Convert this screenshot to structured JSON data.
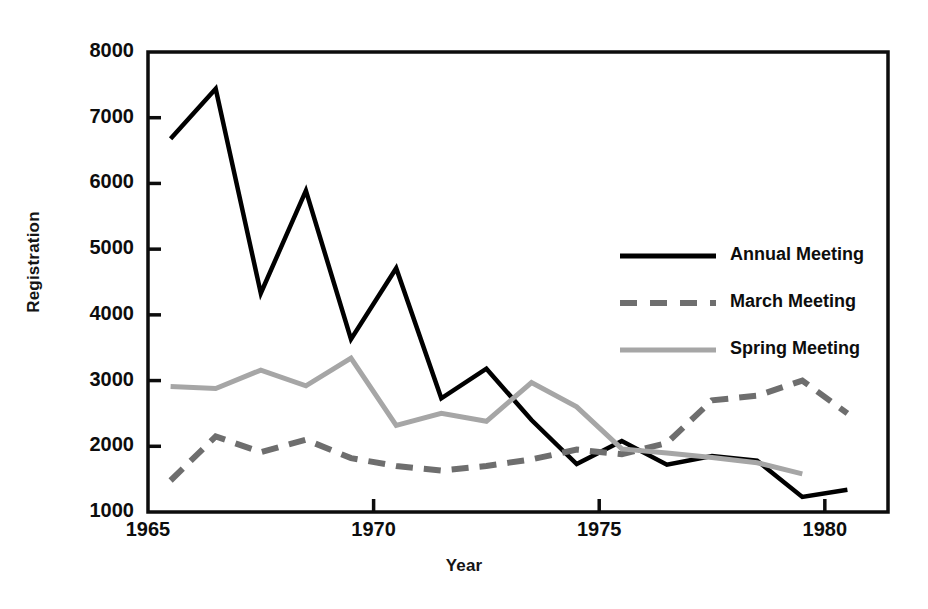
{
  "chart_data": {
    "type": "line",
    "title": "",
    "xlabel": "Year",
    "ylabel": "Registration",
    "xlim": [
      1965,
      1981.4
    ],
    "ylim": [
      1000,
      8000
    ],
    "xticks": [
      1965,
      1970,
      1975,
      1980
    ],
    "xtick_labels": [
      "1965",
      "1970",
      "1975",
      "1980"
    ],
    "yticks": [
      1000,
      2000,
      3000,
      4000,
      5000,
      6000,
      7000,
      8000
    ],
    "ytick_labels": [
      "1000",
      "2000",
      "3000",
      "4000",
      "5000",
      "6000",
      "7000",
      "8000"
    ],
    "grid": false,
    "legend_position": "upper right",
    "frame": "box",
    "series": [
      {
        "name": "Annual Meeting",
        "style": "solid",
        "color": "#000000",
        "width": 4.5,
        "x": [
          1965.5,
          1966.5,
          1967.5,
          1968.5,
          1969.5,
          1970.5,
          1971.5,
          1972.5,
          1973.5,
          1974.5,
          1975.5,
          1976.5,
          1977.5,
          1978.5,
          1979.5,
          1980.5
        ],
        "values": [
          6680,
          7440,
          4330,
          5890,
          3630,
          4710,
          2730,
          3180,
          2400,
          1730,
          2080,
          1720,
          1850,
          1780,
          1230,
          1340
        ]
      },
      {
        "name": "March Meeting",
        "style": "dashed",
        "color": "#6e6e6e",
        "width": 6,
        "x": [
          1965.5,
          1966.5,
          1967.5,
          1968.5,
          1969.5,
          1970.5,
          1971.5,
          1972.5,
          1973.5,
          1974.5,
          1975.5,
          1976.5,
          1977.5,
          1978.5,
          1979.5,
          1980.5
        ],
        "values": [
          1480,
          2150,
          1910,
          2100,
          1820,
          1700,
          1630,
          1700,
          1800,
          1950,
          1880,
          2050,
          2700,
          2770,
          3000,
          2500
        ]
      },
      {
        "name": "Spring Meeting",
        "style": "solid",
        "color": "#a6a6a6",
        "width": 5,
        "x": [
          1965.5,
          1966.5,
          1967.5,
          1968.5,
          1969.5,
          1970.5,
          1971.5,
          1972.5,
          1973.5,
          1974.5,
          1975.5,
          1976.5,
          1977.5,
          1978.5,
          1979.5
        ],
        "values": [
          2910,
          2880,
          3160,
          2920,
          3340,
          2320,
          2500,
          2380,
          2970,
          2600,
          1960,
          1900,
          1830,
          1750,
          1580
        ]
      }
    ],
    "legend": [
      {
        "label": "Annual Meeting",
        "style": "solid",
        "color": "#000000"
      },
      {
        "label": "March Meeting",
        "style": "dashed",
        "color": "#6e6e6e"
      },
      {
        "label": "Spring Meeting",
        "style": "solid",
        "color": "#a6a6a6"
      }
    ]
  },
  "colors": {
    "annual": "#000000",
    "march": "#6e6e6e",
    "spring": "#a6a6a6",
    "axis": "#0d0d0d",
    "background": "#ffffff"
  }
}
